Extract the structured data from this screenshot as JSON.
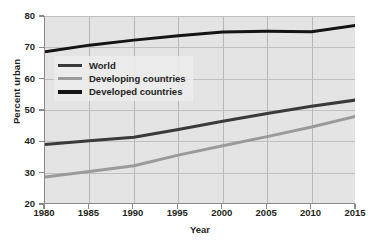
{
  "chart_data": {
    "type": "line",
    "title": "",
    "xlabel": "Year",
    "ylabel": "Percent urban",
    "xlim": [
      1980,
      2015
    ],
    "ylim": [
      20,
      80
    ],
    "xticks": [
      1980,
      1985,
      1990,
      1995,
      2000,
      2005,
      2010,
      2015
    ],
    "yticks": [
      20,
      30,
      40,
      50,
      60,
      70,
      80
    ],
    "grid": true,
    "legend_position": "upper-left-inside",
    "x": [
      1980,
      1985,
      1990,
      1995,
      2000,
      2005,
      2010,
      2015
    ],
    "series": [
      {
        "name": "World",
        "color": "#3a3a3a",
        "values": [
          39.0,
          40.2,
          41.3,
          43.8,
          46.4,
          48.9,
          51.2,
          53.2
        ]
      },
      {
        "name": "Developing countries",
        "color": "#9a9a9a",
        "values": [
          28.6,
          30.4,
          32.2,
          35.6,
          38.6,
          41.5,
          44.6,
          48.0
        ]
      },
      {
        "name": "Developed countries",
        "color": "#141414",
        "values": [
          68.6,
          70.7,
          72.3,
          73.7,
          74.9,
          75.1,
          75.0,
          77.0
        ]
      }
    ]
  },
  "legend": {
    "items": [
      {
        "label": "World",
        "swatch_color": "#3a3a3a"
      },
      {
        "label": "Developing countries",
        "swatch_color": "#9a9a9a"
      },
      {
        "label": "Developed countries",
        "swatch_color": "#141414"
      }
    ]
  },
  "axes": {
    "y_tick_labels": [
      "80",
      "70",
      "60",
      "50",
      "40",
      "30",
      "20"
    ],
    "x_tick_labels": [
      "1980",
      "1985",
      "1990",
      "1995",
      "2000",
      "2005",
      "2010",
      "2015"
    ],
    "y_title": "Percent urban",
    "x_title": "Year"
  },
  "colors": {
    "plot_background": "#e6e6e6",
    "gridline": "#bdbdbd",
    "axis": "#8a8a8a",
    "text": "#231f20",
    "page_background": "#ffffff"
  }
}
